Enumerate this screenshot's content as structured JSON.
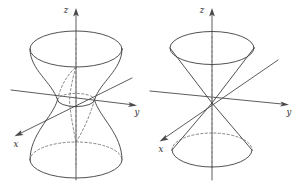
{
  "figure": {
    "background_color": "#ffffff",
    "stroke_color": "#3d3d3d",
    "hidden_stroke_color": "#6a6a6a",
    "panel_count": 2
  },
  "panels": [
    {
      "id": "left-panel",
      "surface_name": "hyperboloid-of-one-sheet",
      "axes": {
        "z": {
          "label": "z",
          "direction": "up"
        },
        "y": {
          "label": "y",
          "direction": "right"
        },
        "x": {
          "label": "x",
          "direction": "lower-left"
        }
      },
      "features": {
        "top_rim": "ellipse",
        "waist_rim": "ellipse",
        "bottom_rim": "ellipse",
        "hidden_back_arcs": "dashed"
      }
    },
    {
      "id": "right-panel",
      "surface_name": "double-cone",
      "axes": {
        "z": {
          "label": "z",
          "direction": "up"
        },
        "y": {
          "label": "y",
          "direction": "right"
        },
        "x": {
          "label": "x",
          "direction": "lower-left"
        }
      },
      "features": {
        "upper_rim": "ellipse",
        "lower_rim": "ellipse",
        "apex": "origin",
        "hidden_back_arcs": "dashed"
      }
    }
  ],
  "labels": {
    "left_z": "z",
    "left_y": "y",
    "left_x": "x",
    "right_z": "z",
    "right_y": "y",
    "right_x": "x"
  }
}
